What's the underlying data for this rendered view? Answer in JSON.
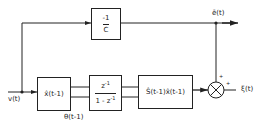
{
  "diagram": {
    "type": "signal-flow block diagram",
    "blocks": {
      "gain": {
        "numerator": "-1",
        "denominator": "C"
      },
      "state_estimate": {
        "label": "x̂(t-1)"
      },
      "integrator": {
        "numerator": "z",
        "numerator_exp": "-1",
        "denominator": "1 - z",
        "denominator_exp": "-1"
      },
      "spectral": {
        "label": "Ŝ(t-1)x̂(t-1)"
      }
    },
    "summing_junction": {
      "sign_top": "+",
      "sign_right": "+"
    },
    "signals": {
      "input": "v(t)",
      "error": "ē(t)",
      "parameter": "θ(t-1)",
      "output": "ξ(t)"
    }
  }
}
